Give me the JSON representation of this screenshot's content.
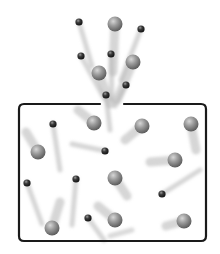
{
  "diagram": {
    "type": "gas-effusion-illustration",
    "colors": {
      "background": "#ffffff",
      "container_stroke": "#1a1a1a",
      "large_particle": "#8a8a8a",
      "small_particle": "#2a2a2a",
      "trail": "#b5b5b5"
    },
    "container": {
      "x": 19,
      "y": 104,
      "width": 187,
      "height": 137,
      "radius": 5,
      "opening": {
        "x1": 100,
        "x2": 124
      }
    },
    "particles_outside": [
      {
        "size": "small",
        "x": 79,
        "y": 22,
        "trail": [
          92,
          66
        ]
      },
      {
        "size": "large",
        "x": 115,
        "y": 24,
        "trail": [
          113,
          72
        ]
      },
      {
        "size": "small",
        "x": 141,
        "y": 29,
        "trail": [
          121,
          80
        ]
      },
      {
        "size": "small",
        "x": 81,
        "y": 56,
        "trail": [
          104,
          98
        ]
      },
      {
        "size": "small",
        "x": 111,
        "y": 54,
        "trail": [
          112,
          100
        ]
      },
      {
        "size": "large",
        "x": 99,
        "y": 73,
        "trail": [
          110,
          104
        ]
      },
      {
        "size": "large",
        "x": 133,
        "y": 62,
        "trail": [
          117,
          100
        ]
      },
      {
        "size": "small",
        "x": 126,
        "y": 85,
        "trail": [
          115,
          106
        ]
      },
      {
        "size": "small",
        "x": 106,
        "y": 95,
        "trail": [
          110,
          130
        ]
      }
    ],
    "particles_inside": [
      {
        "size": "small",
        "x": 53,
        "y": 124,
        "trail": [
          60,
          170
        ]
      },
      {
        "size": "large",
        "x": 94,
        "y": 123,
        "trail": [
          78,
          110
        ]
      },
      {
        "size": "large",
        "x": 142,
        "y": 126,
        "trail": [
          125,
          140
        ]
      },
      {
        "size": "large",
        "x": 191,
        "y": 124,
        "trail": [
          196,
          150
        ]
      },
      {
        "size": "small",
        "x": 105,
        "y": 151,
        "trail": [
          72,
          144
        ]
      },
      {
        "size": "large",
        "x": 38,
        "y": 152,
        "trail": [
          26,
          132
        ]
      },
      {
        "size": "large",
        "x": 175,
        "y": 160,
        "trail": [
          150,
          162
        ]
      },
      {
        "size": "small",
        "x": 27,
        "y": 183,
        "trail": [
          42,
          224
        ]
      },
      {
        "size": "small",
        "x": 76,
        "y": 179,
        "trail": [
          72,
          225
        ]
      },
      {
        "size": "large",
        "x": 115,
        "y": 178,
        "trail": [
          127,
          196
        ]
      },
      {
        "size": "small",
        "x": 162,
        "y": 194,
        "trail": [
          200,
          170
        ]
      },
      {
        "size": "large",
        "x": 52,
        "y": 228,
        "trail": [
          60,
          202
        ]
      },
      {
        "size": "small",
        "x": 88,
        "y": 218,
        "trail": [
          104,
          240
        ]
      },
      {
        "size": "large",
        "x": 115,
        "y": 220,
        "trail": [
          98,
          206
        ]
      },
      {
        "size": "large",
        "x": 184,
        "y": 221,
        "trail": [
          166,
          226
        ]
      },
      {
        "size": "none",
        "x": 0,
        "y": 0,
        "trail": [
          0,
          0
        ]
      }
    ],
    "extra_trails": [
      {
        "from": [
          110,
          236
        ],
        "to": [
          132,
          230
        ]
      }
    ]
  }
}
